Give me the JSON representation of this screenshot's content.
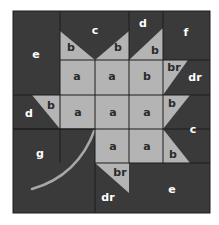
{
  "colors": {
    "dark": "#3a3a3a",
    "light": "#b4b4b4",
    "line": "#1c1c1c",
    "stem": "#a8a8a8",
    "background": "#ffffff"
  },
  "patches": [
    {
      "id": "e-top-left",
      "label": "e",
      "shade": "dark"
    },
    {
      "id": "c-top",
      "label": "c",
      "shade": "dark"
    },
    {
      "id": "b-top-left",
      "label": "b",
      "shade": "light"
    },
    {
      "id": "b-top-mid",
      "label": "b",
      "shade": "light"
    },
    {
      "id": "d-top",
      "label": "d",
      "shade": "dark"
    },
    {
      "id": "b-top-right",
      "label": "b",
      "shade": "light"
    },
    {
      "id": "f-top-right",
      "label": "f",
      "shade": "dark"
    },
    {
      "id": "a-r2c2",
      "label": "a",
      "shade": "light"
    },
    {
      "id": "a-r2c3",
      "label": "a",
      "shade": "light"
    },
    {
      "id": "b-r2c4",
      "label": "b",
      "shade": "light"
    },
    {
      "id": "br-r2c5",
      "label": "br",
      "shade": "light"
    },
    {
      "id": "dr-r2c5",
      "label": "dr",
      "shade": "dark"
    },
    {
      "id": "d-left",
      "label": "d",
      "shade": "dark"
    },
    {
      "id": "b-left",
      "label": "b",
      "shade": "light"
    },
    {
      "id": "a-r3c2",
      "label": "a",
      "shade": "light"
    },
    {
      "id": "a-r3c3",
      "label": "a",
      "shade": "light"
    },
    {
      "id": "a-r3c4",
      "label": "a",
      "shade": "light"
    },
    {
      "id": "b-right-upper",
      "label": "b",
      "shade": "light"
    },
    {
      "id": "c-right",
      "label": "c",
      "shade": "dark"
    },
    {
      "id": "b-right-lower",
      "label": "b",
      "shade": "light"
    },
    {
      "id": "g-bottom-left",
      "label": "g",
      "shade": "dark"
    },
    {
      "id": "a-r4c3",
      "label": "a",
      "shade": "light"
    },
    {
      "id": "a-r4c4",
      "label": "a",
      "shade": "light"
    },
    {
      "id": "br-bottom",
      "label": "br",
      "shade": "light"
    },
    {
      "id": "dr-bottom",
      "label": "dr",
      "shade": "dark"
    },
    {
      "id": "e-bottom-right",
      "label": "e",
      "shade": "dark"
    }
  ]
}
